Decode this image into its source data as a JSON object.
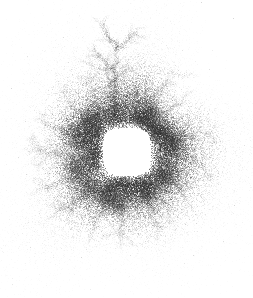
{
  "figure": {
    "title": "",
    "background_color": "#ffffff",
    "width": 253,
    "height": 298,
    "alt_text": "Grayscale particle scatter forming a filamentary shell around a clear central void"
  },
  "chart_data": {
    "type": "scatter",
    "title": "",
    "subtitle": "",
    "xlabel": "",
    "ylabel": "",
    "xlim": [
      0,
      253
    ],
    "ylim": [
      0,
      298
    ],
    "grid": false,
    "legend": false,
    "legend_position": "none",
    "axes_visible": false,
    "tick_labels_x": [],
    "tick_labels_y": [],
    "annotations": [],
    "colormap": "grayscale",
    "point_color": "#303030",
    "point_shape": "dot",
    "point_size_px": 1,
    "total_points": 52000,
    "structure": {
      "description": "dense filamentary shell with central cavity and radial dendritic spikes",
      "center_x": 127,
      "center_y": 152,
      "void_center_x": 127,
      "void_center_y": 152,
      "void_half_width": 24,
      "void_half_height": 24,
      "void_corner_roundness": 0.55,
      "shell_inner_radius": 26,
      "shell_outer_radius": 62,
      "halo_radius": 118,
      "shell_density_peak": 1.0,
      "background_density": 0.004
    },
    "series": [
      {
        "name": "shell-core",
        "color": "#2b2b2b",
        "n_points": 22000,
        "opacity": 0.55,
        "radial_mean": 40,
        "radial_sigma": 13
      },
      {
        "name": "filament-network",
        "color": "#3a3a3a",
        "n_points": 18000,
        "opacity": 0.45,
        "radial_mean": 58,
        "radial_sigma": 24
      },
      {
        "name": "diffuse-halo",
        "color": "#6f6f6f",
        "n_points": 12000,
        "opacity": 0.22,
        "radial_mean": 90,
        "radial_sigma": 38
      }
    ],
    "knots": [
      {
        "x": 78,
        "y": 134,
        "weight": 1.0,
        "radius": 16
      },
      {
        "x": 158,
        "y": 130,
        "weight": 0.95,
        "radius": 15
      },
      {
        "x": 172,
        "y": 144,
        "weight": 0.8,
        "radius": 12
      },
      {
        "x": 92,
        "y": 120,
        "weight": 0.78,
        "radius": 12
      },
      {
        "x": 138,
        "y": 118,
        "weight": 0.7,
        "radius": 11
      },
      {
        "x": 108,
        "y": 196,
        "weight": 0.86,
        "radius": 14
      },
      {
        "x": 146,
        "y": 192,
        "weight": 0.74,
        "radius": 12
      },
      {
        "x": 74,
        "y": 168,
        "weight": 0.72,
        "radius": 12
      },
      {
        "x": 166,
        "y": 176,
        "weight": 0.66,
        "radius": 11
      },
      {
        "x": 118,
        "y": 206,
        "weight": 0.6,
        "radius": 10
      },
      {
        "x": 88,
        "y": 186,
        "weight": 0.62,
        "radius": 11
      },
      {
        "x": 152,
        "y": 112,
        "weight": 0.55,
        "radius": 9
      }
    ],
    "filaments": [
      {
        "x1": 112,
        "y1": 126,
        "x2": 118,
        "y2": 36,
        "weight": 0.85,
        "spread": 1.6
      },
      {
        "x1": 116,
        "y1": 124,
        "x2": 104,
        "y2": 52,
        "weight": 0.5,
        "spread": 1.4
      },
      {
        "x1": 140,
        "y1": 118,
        "x2": 176,
        "y2": 66,
        "weight": 0.45,
        "spread": 1.6
      },
      {
        "x1": 150,
        "y1": 122,
        "x2": 196,
        "y2": 88,
        "weight": 0.4,
        "spread": 1.5
      },
      {
        "x1": 164,
        "y1": 138,
        "x2": 214,
        "y2": 132,
        "weight": 0.55,
        "spread": 1.7
      },
      {
        "x1": 170,
        "y1": 150,
        "x2": 208,
        "y2": 168,
        "weight": 0.4,
        "spread": 1.6
      },
      {
        "x1": 166,
        "y1": 174,
        "x2": 196,
        "y2": 212,
        "weight": 0.42,
        "spread": 1.6
      },
      {
        "x1": 148,
        "y1": 192,
        "x2": 158,
        "y2": 244,
        "weight": 0.5,
        "spread": 1.6
      },
      {
        "x1": 124,
        "y1": 200,
        "x2": 120,
        "y2": 252,
        "weight": 0.46,
        "spread": 1.5
      },
      {
        "x1": 108,
        "y1": 198,
        "x2": 86,
        "y2": 246,
        "weight": 0.48,
        "spread": 1.5
      },
      {
        "x1": 92,
        "y1": 190,
        "x2": 44,
        "y2": 222,
        "weight": 0.52,
        "spread": 1.7
      },
      {
        "x1": 80,
        "y1": 176,
        "x2": 26,
        "y2": 196,
        "weight": 0.5,
        "spread": 1.7
      },
      {
        "x1": 74,
        "y1": 156,
        "x2": 20,
        "y2": 150,
        "weight": 0.45,
        "spread": 1.6
      },
      {
        "x1": 76,
        "y1": 136,
        "x2": 30,
        "y2": 118,
        "weight": 0.48,
        "spread": 1.6
      },
      {
        "x1": 86,
        "y1": 122,
        "x2": 58,
        "y2": 86,
        "weight": 0.46,
        "spread": 1.5
      },
      {
        "x1": 100,
        "y1": 116,
        "x2": 88,
        "y2": 70,
        "weight": 0.4,
        "spread": 1.4
      },
      {
        "x1": 78,
        "y1": 134,
        "x2": 158,
        "y2": 130,
        "weight": 0.3,
        "spread": 2.2
      },
      {
        "x1": 92,
        "y1": 120,
        "x2": 138,
        "y2": 118,
        "weight": 0.32,
        "spread": 2.0
      },
      {
        "x1": 74,
        "y1": 168,
        "x2": 108,
        "y2": 196,
        "weight": 0.4,
        "spread": 2.0
      },
      {
        "x1": 146,
        "y1": 192,
        "x2": 166,
        "y2": 176,
        "weight": 0.4,
        "spread": 2.0
      },
      {
        "x1": 108,
        "y1": 196,
        "x2": 146,
        "y2": 192,
        "weight": 0.38,
        "spread": 2.2
      },
      {
        "x1": 172,
        "y1": 144,
        "x2": 158,
        "y2": 130,
        "weight": 0.42,
        "spread": 1.8
      },
      {
        "x1": 78,
        "y1": 134,
        "x2": 74,
        "y2": 168,
        "weight": 0.42,
        "spread": 1.8
      },
      {
        "x1": 138,
        "y1": 118,
        "x2": 152,
        "y2": 112,
        "weight": 0.35,
        "spread": 1.8
      },
      {
        "x1": 88,
        "y1": 186,
        "x2": 118,
        "y2": 206,
        "weight": 0.34,
        "spread": 1.9
      },
      {
        "x1": 118,
        "y1": 120,
        "x2": 140,
        "y2": 96,
        "weight": 0.3,
        "spread": 1.5
      },
      {
        "x1": 160,
        "y1": 196,
        "x2": 178,
        "y2": 232,
        "weight": 0.3,
        "spread": 1.5
      },
      {
        "x1": 60,
        "y1": 148,
        "x2": 34,
        "y2": 166,
        "weight": 0.3,
        "spread": 1.5
      }
    ]
  }
}
